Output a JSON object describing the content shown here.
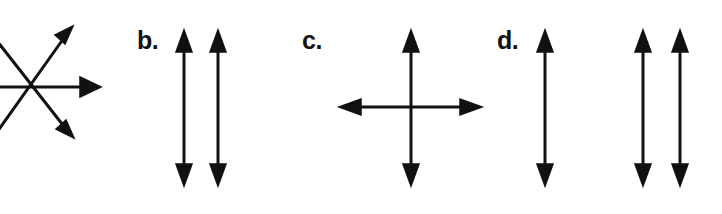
{
  "figure": {
    "width": 722,
    "height": 214,
    "background_color": "#ffffff",
    "stroke_color": "#111111",
    "stroke_width": 3
  },
  "panels": [
    {
      "id": "a",
      "label": "",
      "label_visible": false,
      "note": "leftmost panel is cropped by the left edge of the image; no letter label visible",
      "kind": "radiating-vectors",
      "vertex": {
        "x": 18,
        "y": 87
      },
      "arrow_count": 3,
      "arrows": [
        {
          "name": "up-right-arrow",
          "from": {
            "x": -8,
            "y": 140
          },
          "to": {
            "x": 72,
            "y": 28
          },
          "heads": "end",
          "direction": "up-right"
        },
        {
          "name": "right-arrow",
          "from": {
            "x": -8,
            "y": 87
          },
          "to": {
            "x": 100,
            "y": 87
          },
          "heads": "end",
          "direction": "right"
        },
        {
          "name": "down-right-arrow",
          "from": {
            "x": -8,
            "y": 34
          },
          "to": {
            "x": 72,
            "y": 136
          },
          "heads": "end",
          "direction": "down-right"
        }
      ]
    },
    {
      "id": "b",
      "label": "b.",
      "label_visible": true,
      "label_position": {
        "x": 137,
        "y": 28
      },
      "kind": "parallel-vertical-double-arrows",
      "arrow_count": 2,
      "arrows": [
        {
          "name": "vertical-double-arrow-1",
          "x": 184,
          "y_top": 31,
          "y_bottom": 185,
          "heads": "both",
          "direction": "vertical"
        },
        {
          "name": "vertical-double-arrow-2",
          "x": 218,
          "y_top": 31,
          "y_bottom": 185,
          "heads": "both",
          "direction": "vertical"
        }
      ]
    },
    {
      "id": "c",
      "label": "c.",
      "label_visible": true,
      "label_position": {
        "x": 302,
        "y": 28
      },
      "kind": "crossed-double-arrows",
      "arrow_count": 2,
      "arrows": [
        {
          "name": "vertical-double-arrow",
          "x": 411,
          "y_top": 31,
          "y_bottom": 185,
          "heads": "both",
          "direction": "vertical"
        },
        {
          "name": "horizontal-double-arrow",
          "y": 107,
          "x_left": 340,
          "x_right": 481,
          "heads": "both",
          "direction": "horizontal"
        }
      ],
      "intersection": {
        "x": 411,
        "y": 107
      }
    },
    {
      "id": "d",
      "label": "d.",
      "label_visible": true,
      "label_position": {
        "x": 497,
        "y": 28
      },
      "kind": "parallel-vertical-double-arrows",
      "arrow_count": 3,
      "arrows": [
        {
          "name": "vertical-double-arrow-1",
          "x": 545,
          "y_top": 31,
          "y_bottom": 185,
          "heads": "both",
          "direction": "vertical"
        },
        {
          "name": "vertical-double-arrow-2",
          "x": 643,
          "y_top": 31,
          "y_bottom": 185,
          "heads": "both",
          "direction": "vertical"
        },
        {
          "name": "vertical-double-arrow-3",
          "x": 680,
          "y_top": 31,
          "y_bottom": 185,
          "heads": "both",
          "direction": "vertical"
        }
      ]
    }
  ]
}
